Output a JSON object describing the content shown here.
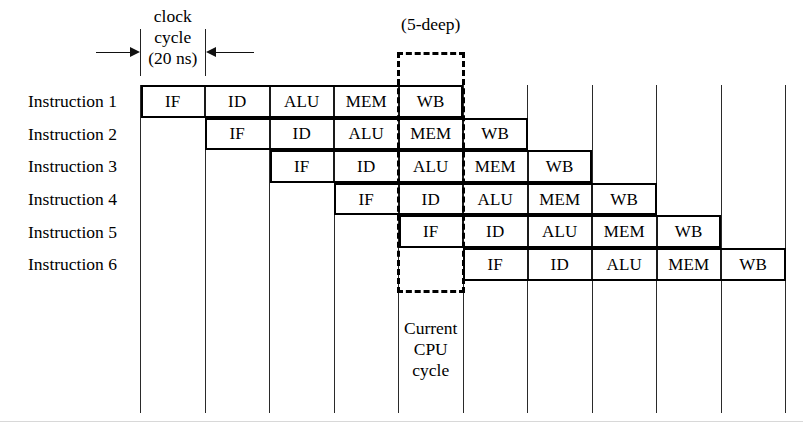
{
  "figure": {
    "type": "cpu-pipeline-timing-diagram",
    "stages": [
      "IF",
      "ID",
      "ALU",
      "MEM",
      "WB"
    ],
    "clock_cycle_label_lines": [
      "clock",
      "cycle",
      "(20 ns)"
    ],
    "depth_label": "(5-deep)",
    "current_cycle_label_lines": [
      "Current",
      "CPU",
      "cycle"
    ],
    "current_cycle_column_index": 4,
    "num_columns": 10,
    "num_rows": 6,
    "rows": [
      {
        "label": "Instruction 1",
        "start_column": 0,
        "cells": [
          "IF",
          "ID",
          "ALU",
          "MEM",
          "WB"
        ]
      },
      {
        "label": "Instruction 2",
        "start_column": 1,
        "cells": [
          "IF",
          "ID",
          "ALU",
          "MEM",
          "WB"
        ]
      },
      {
        "label": "Instruction 3",
        "start_column": 2,
        "cells": [
          "IF",
          "ID",
          "ALU",
          "MEM",
          "WB"
        ]
      },
      {
        "label": "Instruction 4",
        "start_column": 3,
        "cells": [
          "IF",
          "ID",
          "ALU",
          "MEM",
          "WB"
        ]
      },
      {
        "label": "Instruction 5",
        "start_column": 4,
        "cells": [
          "IF",
          "ID",
          "ALU",
          "MEM",
          "WB"
        ]
      },
      {
        "label": "Instruction 6",
        "start_column": 5,
        "cells": [
          "IF",
          "ID",
          "ALU",
          "MEM",
          "WB"
        ]
      }
    ],
    "colors": {
      "ink": "#000000",
      "grid": "#2a2a2a",
      "background": "#ffffff"
    }
  }
}
